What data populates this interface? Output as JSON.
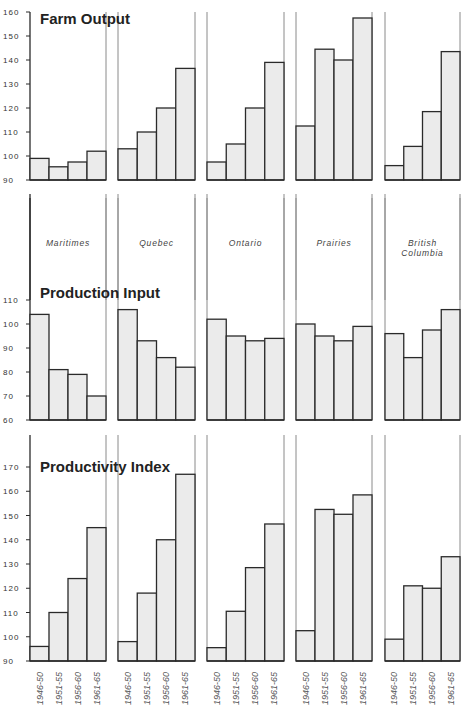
{
  "chart_data": [
    {
      "type": "bar",
      "title": "Farm Output",
      "ylim": [
        90,
        160
      ],
      "yticks": [
        90,
        100,
        110,
        120,
        130,
        140,
        150,
        160
      ],
      "categories": [
        "1946-50",
        "1951-55",
        "1956-60",
        "1961-65"
      ],
      "series": [
        {
          "name": "Maritimes",
          "values": [
            99,
            95.5,
            97.5,
            102
          ]
        },
        {
          "name": "Quebec",
          "values": [
            103,
            110,
            120,
            136.5
          ]
        },
        {
          "name": "Ontario",
          "values": [
            97.5,
            105,
            120,
            139
          ]
        },
        {
          "name": "Prairies",
          "values": [
            112.5,
            144.5,
            140,
            157.5
          ]
        },
        {
          "name": "British Columbia",
          "values": [
            96,
            104,
            118.5,
            143.5
          ]
        }
      ]
    },
    {
      "type": "bar",
      "title": "Production Input",
      "ylim": [
        60,
        110
      ],
      "yticks": [
        60,
        70,
        80,
        90,
        100,
        110
      ],
      "categories": [
        "1946-50",
        "1951-55",
        "1956-60",
        "1961-65"
      ],
      "series": [
        {
          "name": "Maritimes",
          "values": [
            104,
            81,
            79,
            70
          ]
        },
        {
          "name": "Quebec",
          "values": [
            106,
            93,
            86,
            82
          ]
        },
        {
          "name": "Ontario",
          "values": [
            102,
            95,
            93,
            94
          ]
        },
        {
          "name": "Prairies",
          "values": [
            100,
            95,
            93,
            99
          ]
        },
        {
          "name": "British Columbia",
          "values": [
            96,
            86,
            97.5,
            106
          ]
        }
      ]
    },
    {
      "type": "bar",
      "title": "Productivity Index",
      "ylim": [
        90,
        170
      ],
      "yticks": [
        90,
        100,
        110,
        120,
        130,
        140,
        150,
        160,
        170
      ],
      "categories": [
        "1946-50",
        "1951-55",
        "1956-60",
        "1961-65"
      ],
      "series": [
        {
          "name": "Maritimes",
          "values": [
            96,
            110,
            124,
            145
          ]
        },
        {
          "name": "Quebec",
          "values": [
            98,
            118,
            140,
            167
          ]
        },
        {
          "name": "Ontario",
          "values": [
            95.5,
            110.5,
            128.5,
            146.5
          ]
        },
        {
          "name": "Prairies",
          "values": [
            102.5,
            152.5,
            150.5,
            158.5
          ]
        },
        {
          "name": "British Columbia",
          "values": [
            99,
            121,
            120,
            133
          ]
        }
      ]
    }
  ],
  "regions": [
    "Maritimes",
    "Quebec",
    "Ontario",
    "Prairies",
    "British",
    "Columbia"
  ],
  "region_labels": [
    {
      "lines": [
        "Maritimes"
      ]
    },
    {
      "lines": [
        "Quebec"
      ]
    },
    {
      "lines": [
        "Ontario"
      ]
    },
    {
      "lines": [
        "Prairies"
      ]
    },
    {
      "lines": [
        "British",
        "Columbia"
      ]
    }
  ],
  "period_labels": [
    "1946-50",
    "1951-55",
    "1956-60",
    "1961-65"
  ]
}
